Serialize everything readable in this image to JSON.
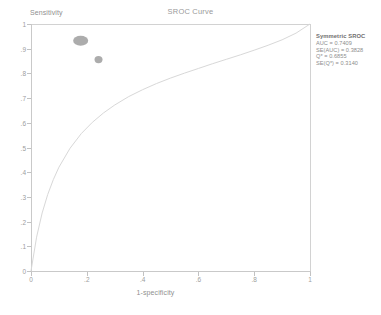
{
  "chart_data": {
    "type": "scatter",
    "title": "SROC Curve",
    "xlabel": "1-specificity",
    "ylabel": "Sensitivity",
    "xlim": [
      0,
      1
    ],
    "ylim": [
      0,
      1
    ],
    "grid": false,
    "x_ticks": [
      {
        "value": 0,
        "label": "0"
      },
      {
        "value": 0.2,
        "label": ".2"
      },
      {
        "value": 0.4,
        "label": ".4"
      },
      {
        "value": 0.6,
        "label": ".6"
      },
      {
        "value": 0.8,
        "label": ".8"
      },
      {
        "value": 1,
        "label": "1"
      }
    ],
    "y_ticks": [
      {
        "value": 0,
        "label": "0"
      },
      {
        "value": 0.1,
        "label": ".1"
      },
      {
        "value": 0.2,
        "label": ".2"
      },
      {
        "value": 0.3,
        "label": ".3"
      },
      {
        "value": 0.4,
        "label": ".4"
      },
      {
        "value": 0.5,
        "label": ".5"
      },
      {
        "value": 0.6,
        "label": ".6"
      },
      {
        "value": 0.7,
        "label": ".7"
      },
      {
        "value": 0.8,
        "label": ".8"
      },
      {
        "value": 0.9,
        "label": ".9"
      },
      {
        "value": 1,
        "label": "1"
      }
    ],
    "series": [
      {
        "name": "Study estimate",
        "marker": "ellipse",
        "color": "#9e9e9e",
        "points": [
          {
            "x": 0.178,
            "y": 0.932,
            "rx": 7.5,
            "ry": 5.0
          },
          {
            "x": 0.242,
            "y": 0.856,
            "rx": 4.0,
            "ry": 3.6
          }
        ]
      }
    ],
    "curve": {
      "name": "Symmetric SROC curve",
      "color": "#d8d8d8",
      "points": [
        {
          "x": 0.0,
          "y": 0.0
        },
        {
          "x": 0.02,
          "y": 0.137
        },
        {
          "x": 0.04,
          "y": 0.235
        },
        {
          "x": 0.06,
          "y": 0.31
        },
        {
          "x": 0.08,
          "y": 0.37
        },
        {
          "x": 0.1,
          "y": 0.42
        },
        {
          "x": 0.14,
          "y": 0.497
        },
        {
          "x": 0.18,
          "y": 0.556
        },
        {
          "x": 0.22,
          "y": 0.602
        },
        {
          "x": 0.26,
          "y": 0.64
        },
        {
          "x": 0.3,
          "y": 0.672
        },
        {
          "x": 0.35,
          "y": 0.706
        },
        {
          "x": 0.4,
          "y": 0.734
        },
        {
          "x": 0.45,
          "y": 0.759
        },
        {
          "x": 0.5,
          "y": 0.781
        },
        {
          "x": 0.55,
          "y": 0.801
        },
        {
          "x": 0.6,
          "y": 0.82
        },
        {
          "x": 0.65,
          "y": 0.839
        },
        {
          "x": 0.7,
          "y": 0.857
        },
        {
          "x": 0.75,
          "y": 0.875
        },
        {
          "x": 0.8,
          "y": 0.894
        },
        {
          "x": 0.85,
          "y": 0.914
        },
        {
          "x": 0.9,
          "y": 0.936
        },
        {
          "x": 0.95,
          "y": 0.963
        },
        {
          "x": 1.0,
          "y": 1.0
        }
      ]
    },
    "annotations": {
      "heading": "Symmetric SROC",
      "lines": [
        "AUC = 0.7409",
        "SE(AUC) = 0.3828",
        "Q* = 0.6855",
        "SE(Q*) = 0.3140"
      ]
    }
  },
  "stats": {
    "heading": "Symmetric SROC",
    "auc": "AUC = 0.7409",
    "se_auc": "SE(AUC) = 0.3828",
    "qstar": "Q* = 0.6855",
    "se_qstar": "SE(Q*) = 0.3140"
  },
  "colors": {
    "marker": "#9e9e9e",
    "curve": "#d8d8d8",
    "axis": "#c9c9c9",
    "text": "#8d8d8d"
  }
}
